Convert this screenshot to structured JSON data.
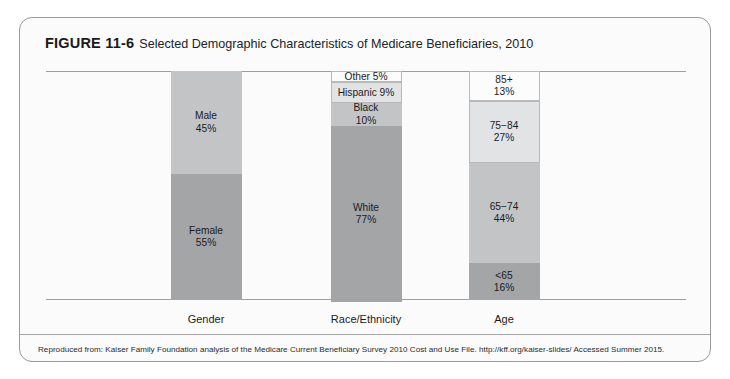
{
  "figure": {
    "number": "FIGURE 11-6",
    "title": "Selected Demographic Characteristics of Medicare Beneficiaries, 2010",
    "citation": "Reproduced from: Kaiser Family Foundation analysis of the Medicare Current Beneficiary Survey 2010 Cost and Use File. http://kff.org/kaiser-slides/ Accessed Summer 2015."
  },
  "chart_data": {
    "type": "bar",
    "subtype": "100% stacked column",
    "title": "Selected Demographic Characteristics of Medicare Beneficiaries, 2010",
    "xlabel": "",
    "ylabel": "",
    "ylim": [
      0,
      100
    ],
    "grid": false,
    "legend": "none (in-segment data labels)",
    "categories": [
      "Gender",
      "Race/Ethnicity",
      "Age"
    ],
    "columns": [
      {
        "category": "Gender",
        "segments": [
          {
            "label": "Male",
            "value": 45,
            "value_label": "45%",
            "color": "#c3c4c6",
            "outlined": false
          },
          {
            "label": "Female",
            "value": 55,
            "value_label": "55%",
            "color": "#a3a5a7",
            "outlined": false
          }
        ]
      },
      {
        "category": "Race/Ethnicity",
        "segments": [
          {
            "label": "Other 5%",
            "value": 5,
            "value_label": "",
            "color": "#fcfcfc",
            "outlined": true,
            "inline": true
          },
          {
            "label": "Hispanic 9%",
            "value": 9,
            "value_label": "",
            "color": "#e2e3e4",
            "outlined": true,
            "inline": true
          },
          {
            "label": "Black",
            "value": 10,
            "value_label": "10%",
            "color": "#c3c4c6",
            "outlined": false
          },
          {
            "label": "White",
            "value": 77,
            "value_label": "77%",
            "color": "#a3a5a7",
            "outlined": false
          }
        ]
      },
      {
        "category": "Age",
        "segments": [
          {
            "label": "85+",
            "value": 13,
            "value_label": "13%",
            "color": "#fcfcfc",
            "outlined": true
          },
          {
            "label": "75−84",
            "value": 27,
            "value_label": "27%",
            "color": "#e2e3e4",
            "outlined": true
          },
          {
            "label": "65−74",
            "value": 44,
            "value_label": "44%",
            "color": "#c3c4c6",
            "outlined": false
          },
          {
            "label": "<65",
            "value": 16,
            "value_label": "16%",
            "color": "#a3a5a7",
            "outlined": false
          }
        ]
      }
    ]
  }
}
